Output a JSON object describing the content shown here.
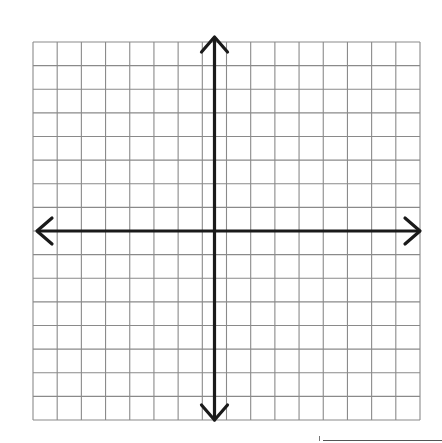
{
  "diagram": {
    "type": "coordinate-plane",
    "grid": {
      "columns": 16,
      "rows": 16
    },
    "axes": {
      "x_axis": {
        "arrows": [
          "left",
          "right"
        ]
      },
      "y_axis": {
        "arrows": [
          "up",
          "down"
        ]
      },
      "origin_cell": {
        "col": 8,
        "row": 8
      }
    },
    "colors": {
      "grid_line": "#8a8a8a",
      "axis": "#1a1a1a",
      "background": "#ffffff"
    }
  }
}
